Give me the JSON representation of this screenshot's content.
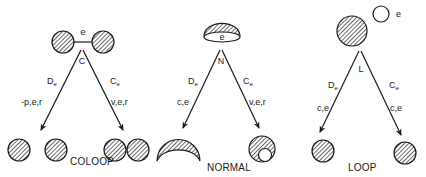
{
  "diagram": {
    "panels": [
      {
        "name": "COLOOP",
        "vertex_label": "C",
        "top_edge_label": "e",
        "left_arrow": {
          "op": "D",
          "sub": "e",
          "edges": "-p,e,r"
        },
        "right_arrow": {
          "op": "C",
          "sub": "e",
          "edges": "v,e,r"
        },
        "caption": "COLOOP"
      },
      {
        "name": "NORMAL",
        "vertex_label": "N",
        "top_edge_label": "e",
        "left_arrow": {
          "op": "D",
          "sub": "e",
          "edges": "c,e"
        },
        "right_arrow": {
          "op": "C",
          "sub": "e",
          "edges": "v,e,r"
        },
        "caption": "NORMAL"
      },
      {
        "name": "LOOP",
        "vertex_label": "L",
        "top_edge_label": "e",
        "left_arrow": {
          "op": "D",
          "sub": "e",
          "edges": "c,e"
        },
        "right_arrow": {
          "op": "C",
          "sub": "e",
          "edges": "c,e"
        },
        "caption": "LOOP"
      }
    ],
    "colors": {
      "ink": "#1a1a1a",
      "background": "#ffffff"
    }
  }
}
